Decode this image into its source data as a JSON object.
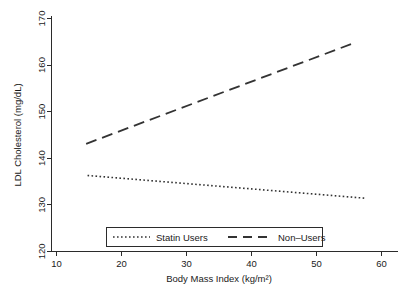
{
  "chart_data": {
    "type": "line",
    "title": "",
    "xlabel": "Body Mass Index (kg/m²)",
    "ylabel": "LDL Cholesterol (mg/dL)",
    "xlim": [
      10,
      60
    ],
    "ylim": [
      120,
      170
    ],
    "xticks": [
      10,
      20,
      30,
      40,
      50,
      60
    ],
    "xtick_labels": [
      "10",
      "20",
      "30",
      "40",
      "50",
      "60"
    ],
    "yticks": [
      120,
      130,
      140,
      150,
      160,
      170
    ],
    "ytick_labels": [
      "120",
      "130",
      "140",
      "150",
      "160",
      "170"
    ],
    "grid": false,
    "legend_position": "bottom-center",
    "series": [
      {
        "name": "Statin Users",
        "style": "dotted",
        "color": "#333333",
        "x": [
          15.2,
          55.4
        ],
        "y": [
          136.3,
          131.4
        ]
      },
      {
        "name": "Non–Users",
        "style": "dashed",
        "color": "#333333",
        "x": [
          15.0,
          53.4
        ],
        "y": [
          143.1,
          164.6
        ]
      }
    ],
    "legend_entries": [
      {
        "label": "Statin Users",
        "style": "dotted"
      },
      {
        "label": "Non–Users",
        "style": "dashed"
      }
    ]
  }
}
